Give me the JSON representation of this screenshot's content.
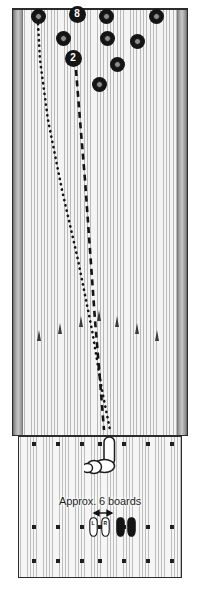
{
  "diagram": {
    "caption": "Approx. 6 boards",
    "colors": {
      "pin": "#141414",
      "pin_highlight": "#8d8d8d",
      "board_light": "#f4f4f4",
      "board_line": "#b9b9b9",
      "outline": "#2b2b2b",
      "gutter_dark": "#4f4f4f",
      "arrow": "#3a3a3a",
      "foot_left": "#ffffff",
      "foot_right": "#141414"
    }
  },
  "lane": {
    "name": "bowling-lane",
    "gutter_left_label": "left-gutter",
    "gutter_right_label": "right-gutter"
  },
  "pins": [
    {
      "id": "pin-a",
      "label": "",
      "x": 38,
      "y": 16,
      "numbered": false
    },
    {
      "id": "pin-b",
      "label": "8",
      "x": 77,
      "y": 14,
      "numbered": true
    },
    {
      "id": "pin-c",
      "label": "",
      "x": 106,
      "y": 16,
      "numbered": false
    },
    {
      "id": "pin-d",
      "label": "",
      "x": 156,
      "y": 16,
      "numbered": false
    },
    {
      "id": "pin-e",
      "label": "",
      "x": 63,
      "y": 38,
      "numbered": false
    },
    {
      "id": "pin-f",
      "label": "",
      "x": 107,
      "y": 38,
      "numbered": false
    },
    {
      "id": "pin-g",
      "label": "",
      "x": 137,
      "y": 41,
      "numbered": false
    },
    {
      "id": "pin-h",
      "label": "2",
      "x": 73,
      "y": 58,
      "numbered": true
    },
    {
      "id": "pin-i",
      "label": "",
      "x": 117,
      "y": 64,
      "numbered": false
    },
    {
      "id": "pin-j",
      "label": "",
      "x": 99,
      "y": 84,
      "numbered": false
    }
  ],
  "lane_arrows": [
    {
      "id": "arrow-1",
      "x": 40,
      "y": 330
    },
    {
      "id": "arrow-2",
      "x": 61,
      "y": 323
    },
    {
      "id": "arrow-3",
      "x": 82,
      "y": 316
    },
    {
      "id": "arrow-4",
      "x": 100,
      "y": 310
    },
    {
      "id": "arrow-5",
      "x": 118,
      "y": 316
    },
    {
      "id": "arrow-6",
      "x": 138,
      "y": 323
    },
    {
      "id": "arrow-7",
      "x": 158,
      "y": 330
    }
  ],
  "ball_paths": [
    {
      "id": "path-dotted",
      "style": "dotted",
      "target_pin": "pin-a",
      "points": "38,24 40,60 48,120 62,190 78,260 92,330 102,390 110,430"
    },
    {
      "id": "path-dashed",
      "style": "dashed",
      "target_pin": "pin-h",
      "points": "76,70 80,120 85,180 90,250 95,320 100,380 104,430"
    }
  ],
  "approach": {
    "name": "approach-area",
    "dot_rows": [
      {
        "id": "dot-row-foul-line",
        "y": 444,
        "xs": [
          34,
          58,
          82,
          100,
          124,
          148,
          172
        ]
      },
      {
        "id": "dot-row-upper",
        "y": 527,
        "xs": [
          34,
          58,
          82,
          100,
          124,
          148,
          172
        ]
      },
      {
        "id": "dot-row-lower",
        "y": 561,
        "xs": [
          34,
          58,
          82,
          100,
          124,
          148,
          172
        ]
      }
    ]
  },
  "hand": {
    "name": "hand-releasing-ball",
    "ball_label": "bowling-ball"
  },
  "feet": [
    {
      "id": "foot-left",
      "label": "L",
      "x": 89,
      "y": 517,
      "fill": "#ffffff"
    },
    {
      "id": "foot-left-inner",
      "label": "R",
      "x": 101,
      "y": 517,
      "fill": "#ffffff"
    },
    {
      "id": "foot-right",
      "label": "",
      "x": 116,
      "y": 517,
      "fill": "#141414"
    },
    {
      "id": "foot-right-inner",
      "label": "",
      "x": 127,
      "y": 517,
      "fill": "#141414"
    }
  ]
}
